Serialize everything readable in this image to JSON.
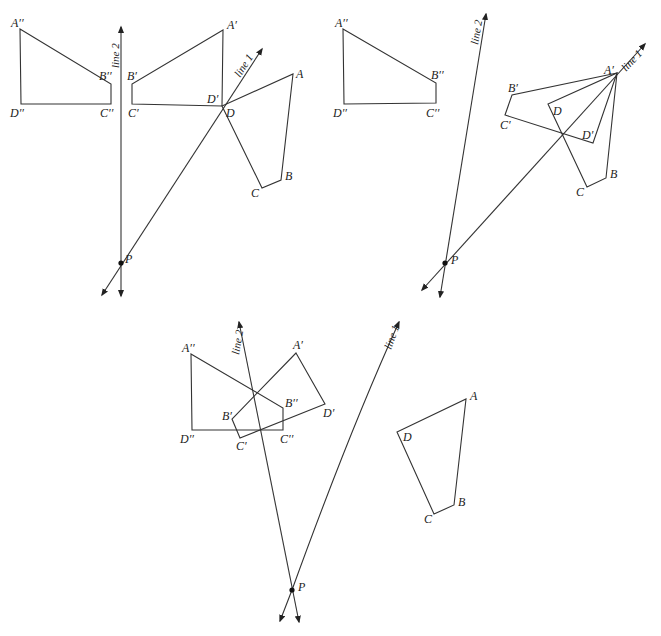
{
  "colors": {
    "stroke": "#333333",
    "text": "#222222",
    "background": "#ffffff"
  },
  "panels": [
    {
      "id": "top-left",
      "line_labels": {
        "line1": "line 1",
        "line2": "line 2"
      },
      "point_label": "P",
      "labels": {
        "A": "A",
        "B": "B",
        "C": "C",
        "D": "D",
        "A1": "A′",
        "B1": "B′",
        "C1": "C′",
        "D1": "D′",
        "A2": "A′′",
        "B2": "B′′",
        "C2": "C′′",
        "D2": "D′′"
      }
    },
    {
      "id": "top-right",
      "line_labels": {
        "line1": "line 1",
        "line2": "line 2"
      },
      "point_label": "P",
      "labels": {
        "A": "A",
        "B": "B",
        "C": "C",
        "D": "D",
        "A1": "A′",
        "B1": "B′",
        "C1": "C′",
        "D1": "D′",
        "A2": "A′′",
        "B2": "B′′",
        "C2": "C′′",
        "D2": "D′′"
      }
    },
    {
      "id": "bottom",
      "line_labels": {
        "line1": "line 1",
        "line2": "line 2"
      },
      "point_label": "P",
      "labels": {
        "A": "A",
        "B": "B",
        "C": "C",
        "D": "D",
        "A1": "A′",
        "B1": "B′",
        "C1": "C′",
        "D1": "D′",
        "A2": "A′′",
        "B2": "B′′",
        "C2": "C′′",
        "D2": "D′′"
      }
    }
  ]
}
